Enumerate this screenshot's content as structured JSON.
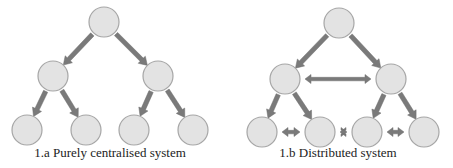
{
  "colors": {
    "node_fill": "#e3e3e3",
    "node_stroke": "#a6a6a6",
    "arrow": "#7a7a7a",
    "text": "#222222"
  },
  "diagrams": [
    {
      "id": "centralised",
      "caption": "1.a Purely centralised system",
      "caption_pos": [
        110,
        145
      ],
      "nodes": [
        {
          "id": "root",
          "x": 104,
          "y": 22
        },
        {
          "id": "mid-left",
          "x": 53,
          "y": 76
        },
        {
          "id": "mid-right",
          "x": 158,
          "y": 76
        },
        {
          "id": "leaf-1",
          "x": 27,
          "y": 130
        },
        {
          "id": "leaf-2",
          "x": 86,
          "y": 130
        },
        {
          "id": "leaf-3",
          "x": 134,
          "y": 130
        },
        {
          "id": "leaf-4",
          "x": 193,
          "y": 130
        }
      ],
      "edges": [
        {
          "from": "root",
          "to": "mid-left",
          "type": "directed"
        },
        {
          "from": "root",
          "to": "mid-right",
          "type": "directed"
        },
        {
          "from": "mid-left",
          "to": "leaf-1",
          "type": "directed"
        },
        {
          "from": "mid-left",
          "to": "leaf-2",
          "type": "directed"
        },
        {
          "from": "mid-right",
          "to": "leaf-3",
          "type": "directed"
        },
        {
          "from": "mid-right",
          "to": "leaf-4",
          "type": "directed"
        }
      ]
    },
    {
      "id": "distributed",
      "caption": "1.b Distributed system",
      "caption_pos": [
        338,
        145
      ],
      "nodes": [
        {
          "id": "root",
          "x": 339,
          "y": 23
        },
        {
          "id": "mid-left",
          "x": 285,
          "y": 79
        },
        {
          "id": "mid-right",
          "x": 391,
          "y": 79
        },
        {
          "id": "leaf-1",
          "x": 262,
          "y": 132
        },
        {
          "id": "leaf-2",
          "x": 320,
          "y": 132
        },
        {
          "id": "leaf-3",
          "x": 367,
          "y": 132
        },
        {
          "id": "leaf-4",
          "x": 424,
          "y": 132
        }
      ],
      "edges": [
        {
          "from": "root",
          "to": "mid-left",
          "type": "directed"
        },
        {
          "from": "root",
          "to": "mid-right",
          "type": "directed"
        },
        {
          "from": "mid-left",
          "to": "leaf-1",
          "type": "directed"
        },
        {
          "from": "mid-left",
          "to": "leaf-2",
          "type": "directed"
        },
        {
          "from": "mid-right",
          "to": "leaf-3",
          "type": "directed"
        },
        {
          "from": "mid-right",
          "to": "leaf-4",
          "type": "directed"
        },
        {
          "from": "mid-left",
          "to": "mid-right",
          "type": "bidirectional"
        },
        {
          "from": "leaf-1",
          "to": "leaf-2",
          "type": "bidirectional"
        },
        {
          "from": "leaf-2",
          "to": "leaf-3",
          "type": "bidirectional"
        },
        {
          "from": "leaf-3",
          "to": "leaf-4",
          "type": "bidirectional"
        }
      ]
    }
  ]
}
